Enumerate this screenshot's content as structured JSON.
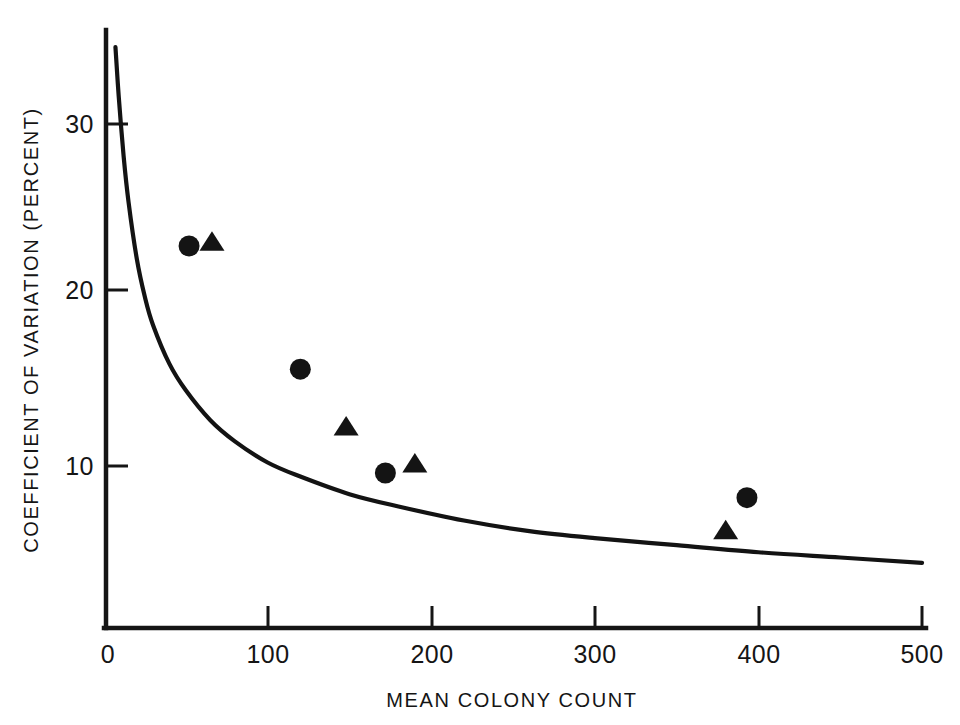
{
  "chart_data": {
    "type": "scatter",
    "title": "",
    "subtitle": "",
    "xlabel": "MEAN COLONY COUNT",
    "ylabel": "COEFFICIENT OF VARIATION (PERCENT)",
    "xlim": [
      0,
      500
    ],
    "ylim": [
      0,
      36
    ],
    "grid": false,
    "legend": "none",
    "x_ticks": [
      0,
      100,
      200,
      300,
      400,
      500
    ],
    "x_tick_labels": [
      "0",
      "100",
      "200",
      "300",
      "400",
      "500"
    ],
    "y_ticks": [
      10,
      20,
      30
    ],
    "y_tick_labels": [
      "10",
      "20",
      "30"
    ],
    "series": [
      {
        "name": "theoretical-poisson-curve",
        "marker": "line",
        "description": "smooth decreasing curve, CV = 100 / sqrt(N)",
        "x": [
          7,
          9,
          12,
          15,
          20,
          25,
          30,
          40,
          50,
          65,
          80,
          100,
          120,
          150,
          180,
          220,
          260,
          300,
          350,
          400,
          450,
          500
        ],
        "y": [
          33.8,
          31.0,
          27.6,
          25.0,
          21.8,
          19.6,
          18.0,
          15.8,
          14.3,
          12.6,
          11.4,
          10.2,
          9.4,
          8.4,
          7.7,
          6.9,
          6.3,
          5.9,
          5.5,
          5.1,
          4.8,
          4.5
        ]
      },
      {
        "name": "circle-observations",
        "marker": "circle",
        "x": [
          52,
          120,
          172,
          393
        ],
        "y": [
          22.5,
          15.5,
          9.6,
          8.2
        ]
      },
      {
        "name": "triangle-observations",
        "marker": "triangle",
        "x": [
          66,
          148,
          190,
          380
        ],
        "y": [
          22.7,
          12.2,
          10.1,
          6.3
        ]
      }
    ]
  },
  "figure": {
    "x_axis_title": "MEAN COLONY COUNT",
    "y_axis_title": "COEFFICIENT OF VARIATION (PERCENT)",
    "x_tick_0": "0",
    "x_tick_100": "100",
    "x_tick_200": "200",
    "x_tick_300": "300",
    "x_tick_400": "400",
    "x_tick_500": "500",
    "y_tick_10": "10",
    "y_tick_20": "20",
    "y_tick_30": "30"
  },
  "colors": {
    "ink": "#151515",
    "background": "#ffffff",
    "marker": "#141414",
    "curve": "#131313"
  }
}
